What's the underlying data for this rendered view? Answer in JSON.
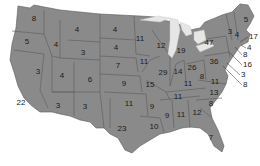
{
  "map": {
    "title": "",
    "region": "United States (contiguous)",
    "fill_color": "#8a8a8a",
    "border_color": "#5a5a5a",
    "lake_color": "#e6e6e6",
    "states": [
      {
        "abbr": "WA",
        "value": "8",
        "x": 34,
        "y": 19
      },
      {
        "abbr": "OR",
        "value": "5",
        "x": 27,
        "y": 42
      },
      {
        "abbr": "CA",
        "value": "22",
        "x": 21,
        "y": 103
      },
      {
        "abbr": "NV",
        "value": "3",
        "x": 38,
        "y": 72
      },
      {
        "abbr": "ID",
        "value": "4",
        "x": 56,
        "y": 45
      },
      {
        "abbr": "MT",
        "value": "4",
        "x": 77,
        "y": 30
      },
      {
        "abbr": "WY",
        "value": "3",
        "x": 83,
        "y": 53
      },
      {
        "abbr": "UT",
        "value": "4",
        "x": 62,
        "y": 76
      },
      {
        "abbr": "CO",
        "value": "6",
        "x": 90,
        "y": 80
      },
      {
        "abbr": "AZ",
        "value": "3",
        "x": 58,
        "y": 106
      },
      {
        "abbr": "NM",
        "value": "3",
        "x": 85,
        "y": 107
      },
      {
        "abbr": "ND",
        "value": "4",
        "x": 115,
        "y": 30
      },
      {
        "abbr": "SD",
        "value": "4",
        "x": 116,
        "y": 48
      },
      {
        "abbr": "NE",
        "value": "7",
        "x": 118,
        "y": 66
      },
      {
        "abbr": "KS",
        "value": "9",
        "x": 124,
        "y": 84
      },
      {
        "abbr": "OK",
        "value": "11",
        "x": 129,
        "y": 104
      },
      {
        "abbr": "TX",
        "value": "23",
        "x": 122,
        "y": 129
      },
      {
        "abbr": "MN",
        "value": "11",
        "x": 140,
        "y": 39
      },
      {
        "abbr": "IA",
        "value": "11",
        "x": 144,
        "y": 62
      },
      {
        "abbr": "MO",
        "value": "15",
        "x": 150,
        "y": 85
      },
      {
        "abbr": "AR",
        "value": "9",
        "x": 152,
        "y": 107
      },
      {
        "abbr": "LA",
        "value": "10",
        "x": 154,
        "y": 127
      },
      {
        "abbr": "WI",
        "value": "12",
        "x": 161,
        "y": 46
      },
      {
        "abbr": "IL",
        "value": "29",
        "x": 163,
        "y": 73
      },
      {
        "abbr": "MI",
        "value": "19",
        "x": 181,
        "y": 51
      },
      {
        "abbr": "IN",
        "value": "14",
        "x": 178,
        "y": 72
      },
      {
        "abbr": "OH",
        "value": "26",
        "x": 192,
        "y": 68
      },
      {
        "abbr": "KY",
        "value": "11",
        "x": 188,
        "y": 84
      },
      {
        "abbr": "TN",
        "value": "11",
        "x": 178,
        "y": 97
      },
      {
        "abbr": "MS",
        "value": "9",
        "x": 167,
        "y": 116
      },
      {
        "abbr": "AL",
        "value": "11",
        "x": 181,
        "y": 115
      },
      {
        "abbr": "GA",
        "value": "12",
        "x": 197,
        "y": 113
      },
      {
        "abbr": "FL",
        "value": "7",
        "x": 211,
        "y": 138
      },
      {
        "abbr": "WV",
        "value": "8",
        "x": 202,
        "y": 77
      },
      {
        "abbr": "VA",
        "value": "11",
        "x": 215,
        "y": 82
      },
      {
        "abbr": "NC",
        "value": "13",
        "x": 214,
        "y": 93
      },
      {
        "abbr": "SC",
        "value": "8",
        "x": 211,
        "y": 104
      },
      {
        "abbr": "NY",
        "value": "47",
        "x": 209,
        "y": 43
      },
      {
        "abbr": "PA",
        "value": "36",
        "x": 214,
        "y": 62
      },
      {
        "abbr": "ME",
        "value": "5",
        "x": 246,
        "y": 20
      },
      {
        "abbr": "VT",
        "value": "3",
        "x": 230,
        "y": 32
      },
      {
        "abbr": "NH",
        "value": "4",
        "x": 237,
        "y": 35
      }
    ],
    "callouts": [
      {
        "abbr": "MA",
        "value": "17",
        "x": 249,
        "y": 37,
        "fx": 240,
        "fy": 42
      },
      {
        "abbr": "RI",
        "value": "4",
        "x": 247,
        "y": 48,
        "fx": 241,
        "fy": 45
      },
      {
        "abbr": "CT",
        "value": "8",
        "x": 243,
        "y": 55,
        "fx": 235,
        "fy": 47
      },
      {
        "abbr": "NJ",
        "value": "16",
        "x": 243,
        "y": 65,
        "fx": 230,
        "fy": 53
      },
      {
        "abbr": "DE",
        "value": "3",
        "x": 241,
        "y": 75,
        "fx": 227,
        "fy": 63
      },
      {
        "abbr": "MD",
        "value": "8",
        "x": 243,
        "y": 85,
        "fx": 223,
        "fy": 66
      }
    ]
  }
}
